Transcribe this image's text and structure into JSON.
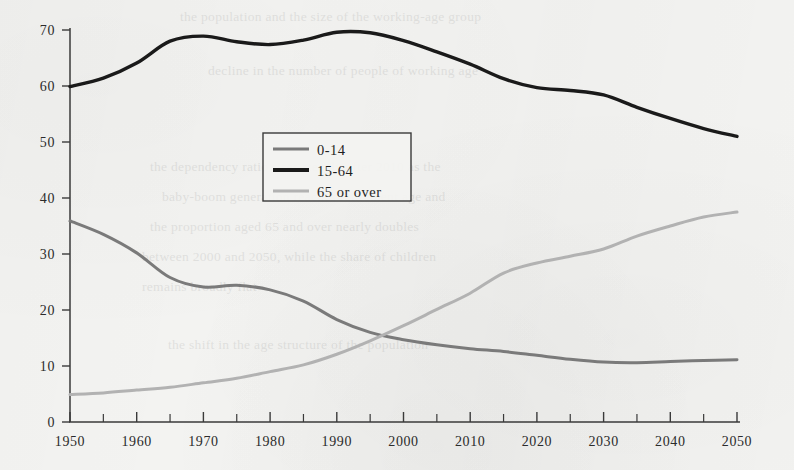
{
  "page": {
    "background_color": "#f3f3f1",
    "ink_color": "#2b2b2b"
  },
  "bleed_through_lines": [
    {
      "text": "the population and the size of the working-age group",
      "x": 180,
      "y": 2
    },
    {
      "text": "decline in the number of people of working age",
      "x": 208,
      "y": 56
    },
    {
      "text": "the dependency ratio rises steeply after 2010 as the",
      "x": 150,
      "y": 152
    },
    {
      "text": "baby-boom generation reaches retirement age and",
      "x": 162,
      "y": 182
    },
    {
      "text": "the proportion aged 65 and over nearly doubles",
      "x": 150,
      "y": 212
    },
    {
      "text": "between 2000 and 2050, while the share of children",
      "x": 142,
      "y": 242
    },
    {
      "text": "remains broadly flat",
      "x": 142,
      "y": 272
    },
    {
      "text": "the shift in the age structure of the population",
      "x": 168,
      "y": 330
    }
  ],
  "chart_data": {
    "type": "line",
    "title": "",
    "subtitle": "",
    "xlabel": "",
    "ylabel": "",
    "xlim": [
      1950,
      2050
    ],
    "ylim": [
      0,
      70
    ],
    "grid": false,
    "legend_position": "upper-center-left",
    "x_ticks_major": [
      1950,
      1960,
      1970,
      1980,
      1990,
      2000,
      2010,
      2020,
      2030,
      2040,
      2050
    ],
    "x_ticks_minor": [
      1955,
      1965,
      1975,
      1985,
      1995,
      2005,
      2015,
      2025,
      2035,
      2045
    ],
    "x_tick_labels": [
      "1950",
      "1960",
      "1970",
      "1980",
      "1990",
      "2000",
      "2010",
      "2020",
      "2030",
      "2040",
      "2050"
    ],
    "y_ticks": [
      0,
      10,
      20,
      30,
      40,
      50,
      60,
      70
    ],
    "y_tick_labels": [
      "0",
      "10",
      "20",
      "30",
      "40",
      "50",
      "60",
      "70"
    ],
    "x": [
      1950,
      1955,
      1960,
      1965,
      1970,
      1975,
      1980,
      1985,
      1990,
      1995,
      2000,
      2005,
      2010,
      2015,
      2020,
      2025,
      2030,
      2035,
      2040,
      2045,
      2050
    ],
    "series": [
      {
        "name": "0-14",
        "color": "#7a7a7a",
        "line_width": 3.0,
        "values": [
          35.9,
          33.5,
          30.2,
          25.8,
          24.1,
          24.4,
          23.6,
          21.6,
          18.3,
          16.0,
          14.7,
          13.8,
          13.1,
          12.6,
          11.9,
          11.2,
          10.7,
          10.6,
          10.8,
          11.0,
          11.1
        ]
      },
      {
        "name": "15-64",
        "color": "#1a1a1a",
        "line_width": 3.4,
        "values": [
          59.9,
          61.4,
          64.1,
          68.0,
          68.9,
          67.9,
          67.4,
          68.2,
          69.6,
          69.5,
          68.1,
          66.1,
          63.9,
          61.3,
          59.7,
          59.2,
          58.4,
          56.2,
          54.2,
          52.4,
          51.0
        ]
      },
      {
        "name": "65 or over",
        "color": "#b2b2b2",
        "line_width": 3.0,
        "values": [
          4.9,
          5.2,
          5.7,
          6.2,
          7.0,
          7.8,
          9.0,
          10.2,
          12.1,
          14.5,
          17.2,
          20.1,
          23.0,
          26.6,
          28.4,
          29.6,
          30.9,
          33.2,
          35.0,
          36.6,
          37.5
        ]
      }
    ],
    "legend_entries": [
      {
        "label": "0-14",
        "color": "#7a7a7a"
      },
      {
        "label": "15-64",
        "color": "#1a1a1a"
      },
      {
        "label": "65 or over",
        "color": "#b2b2b2"
      }
    ],
    "annotations": [
      {
        "text": "0-14 and 65-or-over lines cross",
        "x": 1997,
        "y": 15.3
      }
    ]
  },
  "plot_geometry": {
    "left_px": 70,
    "right_px": 737,
    "top_px": 30,
    "bottom_px": 422
  }
}
